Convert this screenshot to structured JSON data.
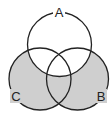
{
  "diagram": {
    "type": "venn",
    "sets": [
      {
        "label": "A",
        "cx": 59.5,
        "cy": 44.5,
        "r": 32
      },
      {
        "label": "B",
        "cx": 77.5,
        "cy": 79,
        "r": 31
      },
      {
        "label": "C",
        "cx": 40,
        "cy": 79,
        "r": 31
      }
    ],
    "shaded_region": "(B ∪ C) − A",
    "colors": {
      "shade": "#cfcfcf",
      "stroke": "#222222",
      "background": "#ffffff"
    }
  }
}
